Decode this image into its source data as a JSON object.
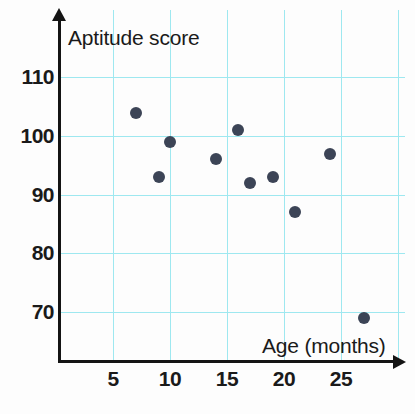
{
  "chart_data": {
    "type": "scatter",
    "title": "",
    "xlabel": "Age (months)",
    "ylabel": "Aptitude score",
    "xlim": [
      0,
      30
    ],
    "ylim": [
      62,
      114
    ],
    "grid": true,
    "legend": null,
    "x_ticks": [
      "5",
      "10",
      "15",
      "20",
      "25"
    ],
    "x_tick_values": [
      5,
      10,
      15,
      20,
      25
    ],
    "y_ticks": [
      "70",
      "80",
      "90",
      "100",
      "110"
    ],
    "y_tick_values": [
      70,
      80,
      90,
      100,
      110
    ],
    "x": [
      7,
      9,
      10,
      14,
      16,
      17,
      19,
      21,
      24,
      27
    ],
    "y": [
      104,
      93,
      99,
      96,
      101,
      92,
      93,
      87,
      97,
      69
    ],
    "points": [
      {
        "x": 7,
        "y": 104
      },
      {
        "x": 9,
        "y": 93
      },
      {
        "x": 10,
        "y": 99
      },
      {
        "x": 14,
        "y": 96
      },
      {
        "x": 16,
        "y": 101
      },
      {
        "x": 17,
        "y": 92
      },
      {
        "x": 19,
        "y": 93
      },
      {
        "x": 21,
        "y": 87
      },
      {
        "x": 24,
        "y": 97
      },
      {
        "x": 27,
        "y": 69
      }
    ],
    "marker_color": "#3c4456",
    "grid_color": "#9ee8f0",
    "axis_color": "#141414",
    "background_color": "#fdfdfd"
  }
}
